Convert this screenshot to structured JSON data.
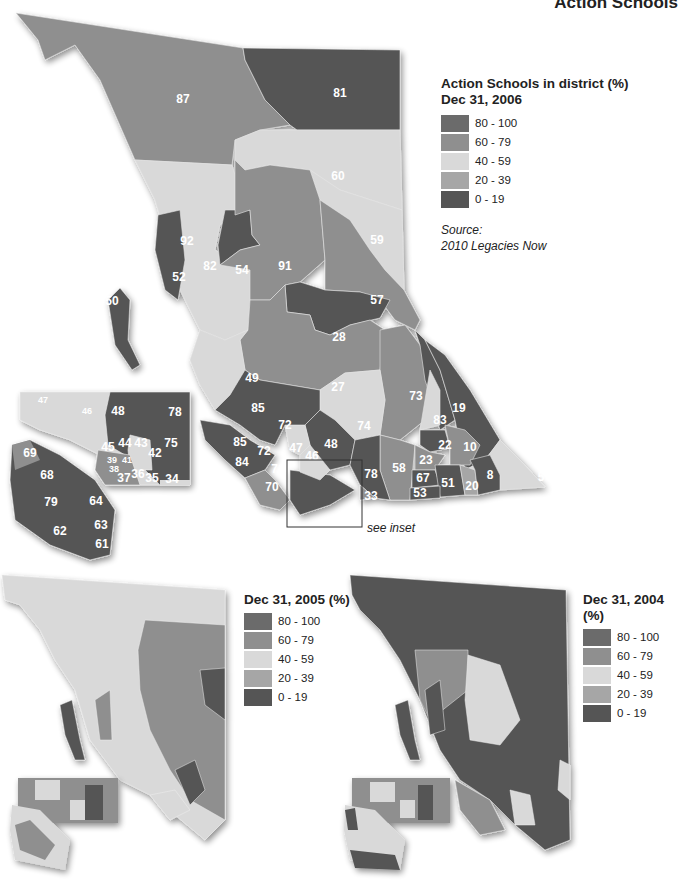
{
  "page": {
    "title": "Action Schools"
  },
  "colors": {
    "c80_100": "#6b6b6b",
    "c60_79": "#8f8f8f",
    "c40_59": "#d9d9d9",
    "c20_39": "#a6a6a6",
    "c0_19": "#555555"
  },
  "main_map": {
    "legend": {
      "title_line1": "Action Schools in district (%)",
      "title_line2": "Dec 31, 2006",
      "items": [
        {
          "label": "80 - 100"
        },
        {
          "label": "60 - 79"
        },
        {
          "label": "40 - 59"
        },
        {
          "label": "20 - 39"
        },
        {
          "label": "0 - 19"
        }
      ],
      "source_label": "Source:",
      "source_value": "2010 Legacies Now"
    },
    "inset_note": "see inset",
    "district_labels": [
      "87",
      "81",
      "60",
      "59",
      "92",
      "82",
      "54",
      "91",
      "57",
      "52",
      "50",
      "28",
      "49",
      "27",
      "73",
      "83",
      "19",
      "6",
      "85",
      "72",
      "74",
      "48",
      "47",
      "46",
      "85",
      "72",
      "84",
      "71",
      "70",
      "78",
      "33",
      "58",
      "22",
      "10",
      "23",
      "67",
      "51",
      "20",
      "8",
      "53",
      "5"
    ],
    "inset_labels": [
      "47",
      "46",
      "48",
      "78",
      "45",
      "44",
      "43",
      "42",
      "75",
      "39",
      "41",
      "38",
      "37",
      "36",
      "35",
      "34",
      "69",
      "68",
      "79",
      "64",
      "63",
      "62",
      "61"
    ]
  },
  "map_2005": {
    "legend": {
      "title": "Dec 31, 2005 (%)",
      "items": [
        {
          "label": "80 - 100"
        },
        {
          "label": "60 - 79"
        },
        {
          "label": "40 - 59"
        },
        {
          "label": "20 - 39"
        },
        {
          "label": "0 - 19"
        }
      ]
    }
  },
  "map_2004": {
    "legend": {
      "title": "Dec 31, 2004 (%)",
      "items": [
        {
          "label": "80 - 100"
        },
        {
          "label": "60 - 79"
        },
        {
          "label": "40 - 59"
        },
        {
          "label": "20 - 39"
        },
        {
          "label": "0 - 19"
        }
      ]
    }
  }
}
